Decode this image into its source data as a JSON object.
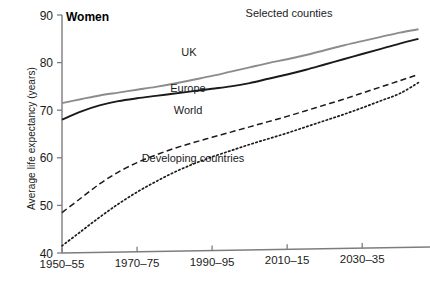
{
  "chart_data": {
    "type": "line",
    "title": "Women",
    "annotation_top_right": "Selected counties",
    "xlabel": "",
    "ylabel": "Average life expectancy (years)",
    "ylim": [
      40,
      90
    ],
    "yticks": [
      40,
      50,
      60,
      70,
      80,
      90
    ],
    "ytick_labels": [
      "40",
      "50",
      "60",
      "70",
      "80",
      "90"
    ],
    "xtick_labels": [
      "1950–55",
      "1970–75",
      "1990–95",
      "2010–15",
      "2030–35"
    ],
    "xtick_values": [
      1950,
      1970,
      1990,
      2010,
      2030
    ],
    "xlim": [
      1950,
      2047
    ],
    "grid": false,
    "legend_position": "inline-annotations",
    "x": [
      1950,
      1955,
      1960,
      1965,
      1970,
      1975,
      1980,
      1985,
      1990,
      1995,
      2000,
      2005,
      2010,
      2015,
      2020,
      2025,
      2030,
      2035,
      2040,
      2045
    ],
    "series": [
      {
        "name": "UK",
        "style": "solid",
        "color": "#8c8c8c",
        "values": [
          71.5,
          72.3,
          73.1,
          73.7,
          74.3,
          74.9,
          75.6,
          76.4,
          77.2,
          78.1,
          79.0,
          79.9,
          80.7,
          81.6,
          82.6,
          83.6,
          84.5,
          85.4,
          86.3,
          87.0
        ]
      },
      {
        "name": "Europe",
        "style": "solid",
        "color": "#1a1a1a",
        "values": [
          68.0,
          69.7,
          71.0,
          71.9,
          72.5,
          73.0,
          73.5,
          74.0,
          74.5,
          75.0,
          75.7,
          76.6,
          77.5,
          78.5,
          79.6,
          80.7,
          81.8,
          82.9,
          84.0,
          85.0
        ]
      },
      {
        "name": "World",
        "style": "dashed",
        "color": "#1a1a1a",
        "values": [
          48.5,
          51.5,
          54.5,
          57.0,
          59.0,
          60.6,
          62.0,
          63.2,
          64.3,
          65.4,
          66.5,
          67.6,
          68.7,
          69.9,
          71.1,
          72.3,
          73.6,
          74.9,
          76.2,
          77.5
        ]
      },
      {
        "name": "Developing countries",
        "style": "dotted",
        "color": "#1a1a1a",
        "values": [
          41.5,
          44.5,
          47.5,
          50.3,
          52.8,
          55.0,
          57.0,
          58.7,
          60.2,
          61.5,
          62.8,
          64.0,
          65.2,
          66.5,
          67.8,
          69.1,
          70.5,
          72.0,
          73.5,
          75.8
        ]
      }
    ],
    "series_labels": [
      {
        "text": "UK",
        "x": 189,
        "y": 56
      },
      {
        "text": "Europe",
        "x": 188,
        "y": 92
      },
      {
        "text": "World",
        "x": 188,
        "y": 114
      },
      {
        "text": "Developing countries",
        "x": 193,
        "y": 162
      }
    ]
  }
}
